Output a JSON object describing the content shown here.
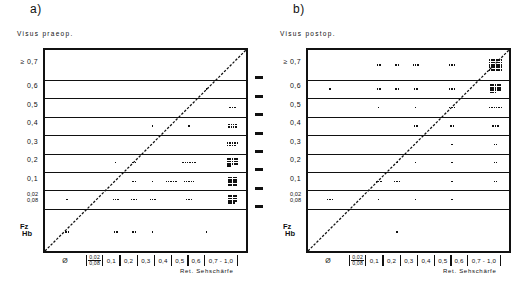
{
  "figure": {
    "panels": [
      {
        "id": "a",
        "label": "a)",
        "yaxis_title": "Visus praeop.",
        "xaxis_title": "Ret. Sehschärfe"
      },
      {
        "id": "b",
        "label": "b)",
        "yaxis_title": "Visus postop.",
        "xaxis_title": "Ret. Sehschärfe"
      }
    ],
    "y_ticks": [
      {
        "label": "≥ 0,7",
        "type": "plain"
      },
      {
        "label": "0,6",
        "type": "plain"
      },
      {
        "label": "0,5",
        "type": "plain"
      },
      {
        "label": "0,4",
        "type": "plain"
      },
      {
        "label": "0,3",
        "type": "plain"
      },
      {
        "label": "0,2",
        "type": "plain"
      },
      {
        "label": "0,1",
        "type": "plain"
      },
      {
        "label": "0,02\n0,08",
        "type": "stack",
        "top": "0,02",
        "bottom": "0,08"
      },
      {
        "label": "Fz\nHb",
        "type": "fzhb",
        "top": "Fz",
        "bottom": "Hb"
      }
    ],
    "x_ticks": [
      {
        "label": "Ø",
        "type": "plain"
      },
      {
        "label": "0,02/0,08",
        "type": "frac",
        "top": "0,02",
        "bottom": "0,08"
      },
      {
        "label": "0,1",
        "type": "box"
      },
      {
        "label": "0,2",
        "type": "box"
      },
      {
        "label": "0,3",
        "type": "box"
      },
      {
        "label": "0,4",
        "type": "box"
      },
      {
        "label": "0,5",
        "type": "box"
      },
      {
        "label": "0,6",
        "type": "box"
      },
      {
        "label": "0,7 - 1,0",
        "type": "box"
      }
    ]
  },
  "chart_data": {
    "type": "scatter",
    "xlabel": "Ret. Sehschärfe",
    "x_categories": [
      "Ø",
      "0,02/0,08",
      "0,1",
      "0,2",
      "0,3",
      "0,4",
      "0,5",
      "0,6",
      "0,7 - 1,0"
    ],
    "y_categories": [
      "≥ 0,7",
      "0,6",
      "0,5",
      "0,4",
      "0,3",
      "0,2",
      "0,1",
      "0,02/0,08",
      "Fz/Hb"
    ],
    "grid": "horizontal",
    "legend": "none",
    "annotations": [
      "diagonal identity line y = x"
    ],
    "panels": [
      {
        "id": "a",
        "ylabel": "Visus praeop.",
        "counts": [
          {
            "x": "0,6",
            "y": "0,6",
            "n": 1
          },
          {
            "x": "0,7 - 1,0",
            "y": "0,5",
            "n": 3
          },
          {
            "x": "0,3",
            "y": "0,4",
            "n": 1
          },
          {
            "x": "0,5",
            "y": "0,4",
            "n": 1
          },
          {
            "x": "0,7 - 1,0",
            "y": "0,4",
            "n": 8
          },
          {
            "x": "0,7 - 1,0",
            "y": "0,3",
            "n": 9
          },
          {
            "x": "0,7 - 1,0",
            "y": "0,2",
            "n": 1
          },
          {
            "x": "0,1",
            "y": "0,2",
            "n": 1
          },
          {
            "x": "0,2",
            "y": "0,2",
            "n": 2
          },
          {
            "x": "0,5",
            "y": "0,2",
            "n": 6
          },
          {
            "x": "0,7 - 1,0",
            "y": "0,2",
            "n": 16
          },
          {
            "x": "0,2",
            "y": "0,1",
            "n": 2
          },
          {
            "x": "0,3",
            "y": "0,1",
            "n": 1
          },
          {
            "x": "0,4",
            "y": "0,1",
            "n": 5
          },
          {
            "x": "0,5",
            "y": "0,1",
            "n": 5
          },
          {
            "x": "0,7 - 1,0",
            "y": "0,1",
            "n": 16
          },
          {
            "x": "Ø",
            "y": "0,02/0,08",
            "n": 1
          },
          {
            "x": "0,1",
            "y": "0,02/0,08",
            "n": 3
          },
          {
            "x": "0,2",
            "y": "0,02/0,08",
            "n": 3
          },
          {
            "x": "0,3",
            "y": "0,02/0,08",
            "n": 3
          },
          {
            "x": "0,5",
            "y": "0,02/0,08",
            "n": 3
          },
          {
            "x": "0,7 - 1,0",
            "y": "0,02/0,08",
            "n": 15
          },
          {
            "x": "Ø",
            "y": "Fz/Hb",
            "n": 2
          },
          {
            "x": "0,1",
            "y": "Fz/Hb",
            "n": 2
          },
          {
            "x": "0,2",
            "y": "Fz/Hb",
            "n": 2
          },
          {
            "x": "0,3",
            "y": "Fz/Hb",
            "n": 1
          },
          {
            "x": "0,6",
            "y": "Fz/Hb",
            "n": 1
          }
        ]
      },
      {
        "id": "b",
        "ylabel": "Visus postop.",
        "counts": [
          {
            "x": "0,1",
            "y": "≥ 0,7",
            "n": 2
          },
          {
            "x": "0,2",
            "y": "≥ 0,7",
            "n": 2
          },
          {
            "x": "0,3",
            "y": "≥ 0,7",
            "n": 3
          },
          {
            "x": "0,5",
            "y": "≥ 0,7",
            "n": 3
          },
          {
            "x": "0,7 - 1,0",
            "y": "≥ 0,7",
            "n": 30
          },
          {
            "x": "Ø",
            "y": "0,6",
            "n": 1
          },
          {
            "x": "0,1",
            "y": "0,6",
            "n": 2
          },
          {
            "x": "0,2",
            "y": "0,6",
            "n": 2
          },
          {
            "x": "0,3",
            "y": "0,6",
            "n": 2
          },
          {
            "x": "0,5",
            "y": "0,6",
            "n": 3
          },
          {
            "x": "0,7 - 1,0",
            "y": "0,6",
            "n": 18
          },
          {
            "x": "0,1",
            "y": "0,5",
            "n": 1
          },
          {
            "x": "0,3",
            "y": "0,5",
            "n": 1
          },
          {
            "x": "0,5",
            "y": "0,5",
            "n": 3
          },
          {
            "x": "0,7 - 1,0",
            "y": "0,5",
            "n": 6
          },
          {
            "x": "0,3",
            "y": "0,4",
            "n": 2
          },
          {
            "x": "0,5",
            "y": "0,4",
            "n": 2
          },
          {
            "x": "0,7 - 1,0",
            "y": "0,4",
            "n": 3
          },
          {
            "x": "0,5",
            "y": "0,3",
            "n": 1
          },
          {
            "x": "0,7 - 1,0",
            "y": "0,3",
            "n": 2
          },
          {
            "x": "0,2",
            "y": "0,2",
            "n": 1
          },
          {
            "x": "0,3",
            "y": "0,2",
            "n": 1
          },
          {
            "x": "0,5",
            "y": "0,2",
            "n": 1
          },
          {
            "x": "0,7 - 1,0",
            "y": "0,2",
            "n": 2
          },
          {
            "x": "0,1",
            "y": "0,1",
            "n": 3
          },
          {
            "x": "0,2",
            "y": "0,1",
            "n": 3
          },
          {
            "x": "0,5",
            "y": "0,1",
            "n": 1
          },
          {
            "x": "0,7 - 1,0",
            "y": "0,1",
            "n": 2
          },
          {
            "x": "Ø",
            "y": "0,02/0,08",
            "n": 3
          },
          {
            "x": "0,1",
            "y": "0,02/0,08",
            "n": 1
          },
          {
            "x": "0,3",
            "y": "0,02/0,08",
            "n": 1
          },
          {
            "x": "0,5",
            "y": "0,02/0,08",
            "n": 1
          },
          {
            "x": "0,2",
            "y": "Fz/Hb",
            "n": 1
          }
        ]
      }
    ]
  }
}
